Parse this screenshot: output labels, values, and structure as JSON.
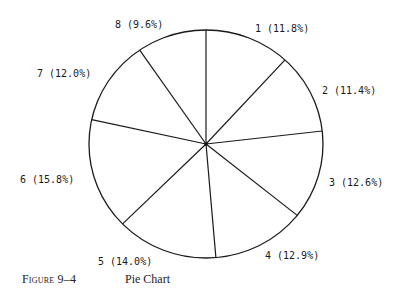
{
  "chart_data": {
    "type": "pie",
    "title": "Pie Chart",
    "figure_number": "FIGURE 9–4",
    "categories": [
      "1",
      "2",
      "3",
      "4",
      "5",
      "6",
      "7",
      "8"
    ],
    "values": [
      11.8,
      11.4,
      12.6,
      12.9,
      14.0,
      15.8,
      12.0,
      9.6
    ],
    "labels": [
      "1 (11.8%)",
      "2 (11.4%)",
      "3 (12.6%)",
      "4 (12.9%)",
      "5 (14.0%)",
      "6 (15.8%)",
      "7 (12.0%)",
      "8 (9.6%)"
    ],
    "start_angle": "12 o'clock",
    "direction": "clockwise",
    "fill": "none",
    "stroke": "#1a1a1a",
    "legend": "none",
    "grid": false
  },
  "caption": {
    "figure": "Figure 9–4",
    "title": "Pie Chart"
  }
}
